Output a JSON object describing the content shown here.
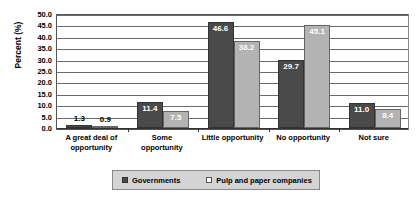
{
  "chart_data": {
    "type": "bar",
    "title": "",
    "xlabel": "",
    "ylabel": "Percent (%)",
    "ylim": [
      0,
      50
    ],
    "ytick_step": 5,
    "grid": true,
    "legend_position": "bottom",
    "categories": [
      "A great deal of opportunity",
      "Some opportunity",
      "Little opportunity",
      "No opportunity",
      "Not sure"
    ],
    "category_lines": [
      [
        "A great deal of",
        "opportunity"
      ],
      [
        "Some",
        "opportunity"
      ],
      [
        "Little opportunity"
      ],
      [
        "No opportunity"
      ],
      [
        "Not sure"
      ]
    ],
    "ytick_labels": [
      "50.0",
      "45.0",
      "40.0",
      "35.0",
      "30.0",
      "25.0",
      "20.0",
      "15.0",
      "10.0",
      "5.0",
      "0.0"
    ],
    "series": [
      {
        "name": "Governments",
        "color": "#4a4a4a",
        "values": [
          1.3,
          11.4,
          46.6,
          29.7,
          11.0
        ],
        "value_labels": [
          "1.3",
          "11.4",
          "46.6",
          "29.7",
          "11.0"
        ]
      },
      {
        "name": "Pulp and paper companies",
        "color": "#b3b3b3",
        "values": [
          0.9,
          7.5,
          38.2,
          45.1,
          8.4
        ],
        "value_labels": [
          "0.9",
          "7.5",
          "38.2",
          "45.1",
          "8.4"
        ]
      }
    ]
  },
  "legend": {
    "items": [
      {
        "label": "Governments",
        "swatch": "dark"
      },
      {
        "label": "Pulp and paper companies",
        "swatch": "light"
      }
    ]
  }
}
